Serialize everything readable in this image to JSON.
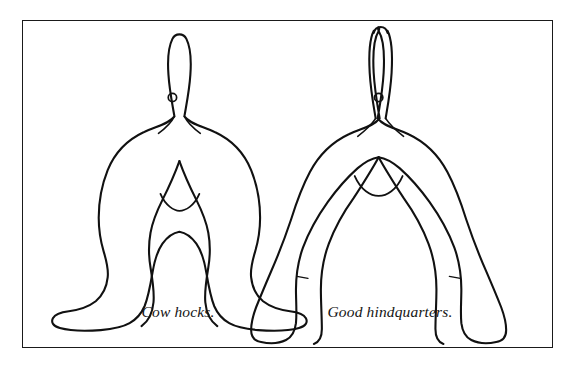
{
  "page": {
    "background_color": "#ffffff",
    "frame_border_color": "#1a1a1a",
    "ink_color": "#111111"
  },
  "figure": {
    "caption_left": "Cow hocks.",
    "caption_right": "Good hindquarters.",
    "panels": [
      {
        "id": "cow-hocks",
        "caption": "Cow hocks.",
        "description": "Rear view line drawing of hindquarters with hocks turned inward and feet splayed outward"
      },
      {
        "id": "good-hindquarters",
        "caption": "Good hindquarters.",
        "description": "Rear view line drawing of correct hindquarters with straight parallel legs and feet pointing forward"
      }
    ]
  },
  "bottom_text": {
    "cut_off_line": "        "
  }
}
